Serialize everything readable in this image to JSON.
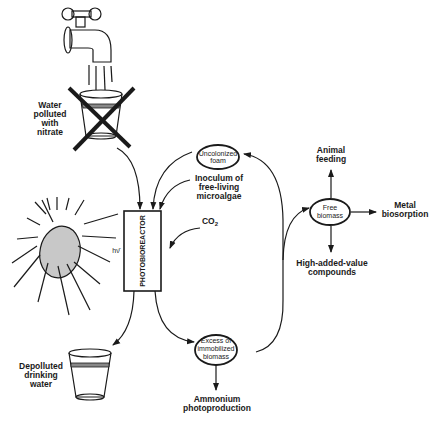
{
  "diagram": {
    "type": "process-flow",
    "nodes": {
      "water_source": {
        "label_lines": [
          "Water",
          "polluted",
          "with",
          "nitrate"
        ],
        "status": "crossed-out"
      },
      "photoreactor": {
        "label": "PHOTOBIOREACTOR"
      },
      "light": {
        "label": "hν̄"
      },
      "uncolonized_foam": {
        "label_lines": [
          "Uncolonized",
          "foam"
        ]
      },
      "inoculum": {
        "label_lines": [
          "Inoculum of",
          "free-living",
          "microalgae"
        ]
      },
      "co2": {
        "label": "CO",
        "sub": "2"
      },
      "free_biomass": {
        "label_lines": [
          "Free",
          "biomass"
        ]
      },
      "animal_feeding": {
        "label_lines": [
          "Animal",
          "feeding"
        ]
      },
      "metal_biosorption": {
        "label_lines": [
          "Metal",
          "biosorption"
        ]
      },
      "high_value": {
        "label_lines": [
          "High-added-value",
          "compounds"
        ]
      },
      "excess_biomass": {
        "label_lines": [
          "Excess of",
          "immobilized",
          "biomass"
        ]
      },
      "ammonium": {
        "label_lines": [
          "Ammonium",
          "photoproduction"
        ]
      },
      "drinking_water": {
        "label_lines": [
          "Depolluted",
          "drinking",
          "water"
        ]
      }
    },
    "edges": [
      {
        "from": "water_source",
        "to": "photoreactor"
      },
      {
        "from": "uncolonized_foam",
        "to": "photoreactor"
      },
      {
        "from": "inoculum",
        "to": "photoreactor"
      },
      {
        "from": "co2",
        "to": "photoreactor"
      },
      {
        "from": "light",
        "to": "photoreactor"
      },
      {
        "from": "photoreactor",
        "to": "drinking_water"
      },
      {
        "from": "photoreactor",
        "to": "excess_biomass"
      },
      {
        "from": "excess_biomass",
        "to": "uncolonized_foam"
      },
      {
        "from": "excess_biomass",
        "to": "free_biomass"
      },
      {
        "from": "excess_biomass",
        "to": "ammonium"
      },
      {
        "from": "free_biomass",
        "to": "animal_feeding"
      },
      {
        "from": "free_biomass",
        "to": "metal_biosorption"
      },
      {
        "from": "free_biomass",
        "to": "high_value"
      }
    ]
  }
}
